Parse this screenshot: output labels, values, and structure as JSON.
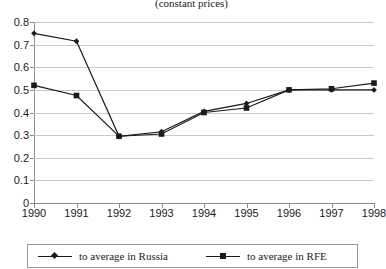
{
  "chart_data": {
    "type": "line",
    "title": "(constant  prices)",
    "xlabel": "",
    "ylabel": "",
    "categories": [
      "1990",
      "1991",
      "1992",
      "1993",
      "1994",
      "1995",
      "1996",
      "1997",
      "1998"
    ],
    "x": [
      1990,
      1991,
      1992,
      1993,
      1994,
      1995,
      1996,
      1997,
      1998
    ],
    "series": [
      {
        "name": "to average in Russia",
        "marker": "diamond",
        "color": "#1a1a1a",
        "values": [
          0.75,
          0.715,
          0.295,
          0.315,
          0.405,
          0.44,
          0.5,
          0.5,
          0.5
        ]
      },
      {
        "name": "to average in RFE",
        "marker": "square",
        "color": "#1a1a1a",
        "values": [
          0.52,
          0.475,
          0.295,
          0.305,
          0.4,
          0.42,
          0.5,
          0.505,
          0.53
        ]
      }
    ],
    "ylim": [
      0,
      0.8
    ],
    "yticks": [
      "0",
      "0.1",
      "0.2",
      "0.3",
      "0.4",
      "0.5",
      "0.6",
      "0.7",
      "0.8"
    ],
    "ytick_values": [
      0,
      0.1,
      0.2,
      0.3,
      0.4,
      0.5,
      0.6,
      0.7,
      0.8
    ],
    "grid": true,
    "grid_axis": "y",
    "legend_position": "bottom",
    "legend_entries": [
      "to average in Russia",
      "to average in RFE"
    ]
  },
  "legend": {
    "russia_label": "to average in Russia",
    "rfe_label": "to average in RFE"
  }
}
